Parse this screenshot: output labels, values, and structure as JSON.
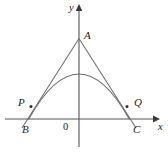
{
  "figure": {
    "background_color": "#ffffff",
    "stroke_color": "#6d6d6d",
    "axis_color": "#555555",
    "label_color": "#1d1d1d",
    "width": 168,
    "height": 153
  },
  "axes": {
    "x_label": "x",
    "y_label": "y",
    "origin_label": "0",
    "x_axis": {
      "x1": 5,
      "y1": 119,
      "x2": 156,
      "y2": 119
    },
    "y_axis": {
      "x1": 79,
      "y1": 146,
      "x2": 79,
      "y2": 7
    },
    "x_arrow": {
      "x": 156,
      "y": 119
    },
    "y_arrow": {
      "x": 79,
      "y": 7
    }
  },
  "points": [
    {
      "id": "A",
      "label": "A",
      "x": 79,
      "y": 38,
      "role": "apex"
    },
    {
      "id": "P",
      "label": "P",
      "x": 31,
      "y": 106,
      "role": "tangent-point-left"
    },
    {
      "id": "Q",
      "label": "Q",
      "x": 127,
      "y": 106,
      "role": "tangent-point-right"
    },
    {
      "id": "B",
      "label": "B",
      "x": 29,
      "y": 119,
      "role": "x-intercept-left"
    },
    {
      "id": "C",
      "label": "C",
      "x": 129,
      "y": 119,
      "role": "x-intercept-right"
    }
  ],
  "curves": {
    "parabola": {
      "name": "parabola",
      "vertex": {
        "x": 79,
        "y": 74
      },
      "left_root": {
        "x": 29,
        "y": 119
      },
      "right_root": {
        "x": 129,
        "y": 119
      },
      "path": "M 29 119 Q 79 29 129 119"
    },
    "tangent_left": {
      "name": "tangent-line-left",
      "from": {
        "x": 79,
        "y": 38
      },
      "to": {
        "x": 23,
        "y": 127
      },
      "touches": "P"
    },
    "tangent_right": {
      "name": "tangent-line-right",
      "from": {
        "x": 79,
        "y": 38
      },
      "to": {
        "x": 135,
        "y": 127
      },
      "touches": "Q"
    }
  }
}
